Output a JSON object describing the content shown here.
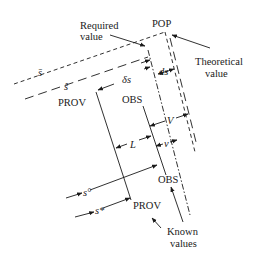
{
  "diagram": {
    "labels": {
      "required": "Required",
      "required_line2": "value",
      "pop": "POP",
      "theoretical": "Theoretical",
      "theoretical_line2": "value",
      "s_bar": "s̄",
      "s_hat": "ŝ",
      "prov_top": "PROV",
      "delta_s": "δs",
      "ds": "ds",
      "obs_top": "OBS",
      "V": "V",
      "L": "L",
      "v": "v",
      "obs_bottom": "OBS",
      "s_circ": "s°",
      "s_star": "s*",
      "prov_bottom": "PROV",
      "known": "Known",
      "known_line2": "values"
    },
    "colors": {
      "ink": "#1a1a1a",
      "background": "#ffffff"
    }
  }
}
